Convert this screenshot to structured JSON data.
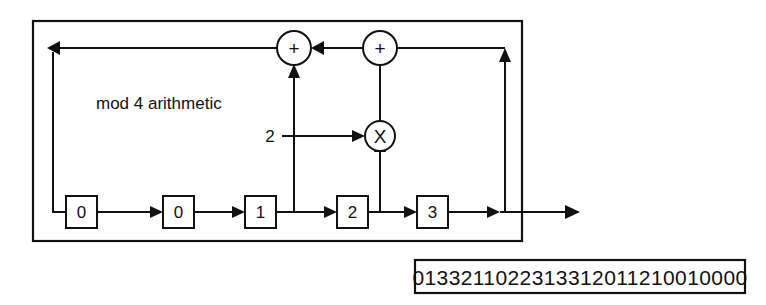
{
  "diagram": {
    "title_label": "mod 4 arithmetic",
    "registers": [
      {
        "name": "register-0",
        "value": "0"
      },
      {
        "name": "register-1",
        "value": "0"
      },
      {
        "name": "register-2",
        "value": "1"
      },
      {
        "name": "register-3",
        "value": "2"
      },
      {
        "name": "register-4",
        "value": "3"
      }
    ],
    "operators": [
      {
        "name": "adder-left",
        "glyph": "+"
      },
      {
        "name": "adder-right",
        "glyph": "+"
      },
      {
        "name": "multiplier",
        "glyph": "X"
      }
    ],
    "constant_input": "2",
    "colors": {
      "line": "#111111",
      "background": "#ffffff",
      "fill": "#ffffff"
    }
  },
  "output": {
    "sequence": "0133211022313312011210010000"
  }
}
